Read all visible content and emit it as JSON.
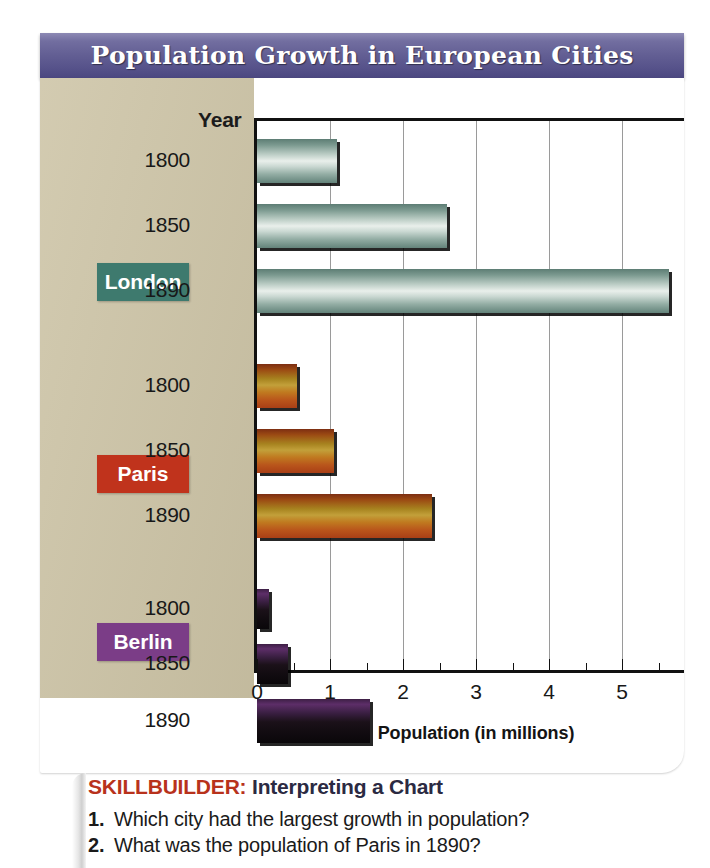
{
  "title": "Population Growth in European Cities",
  "chart": {
    "year_header": "Year",
    "axis_title": "Population (in millions)",
    "x_tick_labels": [
      "0",
      "1",
      "2",
      "3",
      "4",
      "5",
      "6"
    ],
    "city_labels": [
      "London",
      "Paris",
      "Berlin"
    ],
    "city_colors": [
      "#3e7a6e",
      "#c0331c",
      "#7b3d87"
    ],
    "row_labels": [
      "1800",
      "1850",
      "1890",
      "1800",
      "1850",
      "1890",
      "1800",
      "1850",
      "1890"
    ]
  },
  "chart_data": {
    "type": "bar",
    "orientation": "horizontal",
    "title": "Population Growth in European Cities",
    "xlabel": "Population (in millions)",
    "ylabel": "Year",
    "xlim": [
      0,
      6
    ],
    "xticks": [
      0,
      1,
      2,
      3,
      4,
      5,
      6
    ],
    "minor_tick_step": 0.5,
    "grid": true,
    "legend": "none",
    "groups": [
      {
        "name": "London",
        "color": "#3e7a6e",
        "categories": [
          "1800",
          "1850",
          "1890"
        ],
        "values": [
          1.1,
          2.6,
          5.65
        ]
      },
      {
        "name": "Paris",
        "color": "#c0331c",
        "categories": [
          "1800",
          "1850",
          "1890"
        ],
        "values": [
          0.55,
          1.05,
          2.4
        ]
      },
      {
        "name": "Berlin",
        "color": "#7b3d87",
        "categories": [
          "1800",
          "1850",
          "1890"
        ],
        "values": [
          0.17,
          0.42,
          1.55
        ]
      }
    ]
  },
  "skillbuilder": {
    "label": "SKILLBUILDER:",
    "title": "Interpreting a Chart",
    "questions": [
      {
        "num": "1.",
        "text": "Which city had the largest growth in population?"
      },
      {
        "num": "2.",
        "text": "What was the population of Paris in 1890?"
      }
    ]
  }
}
